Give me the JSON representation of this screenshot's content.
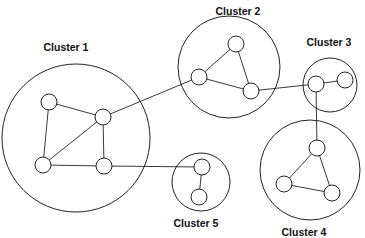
{
  "diagram": {
    "type": "network-clusters",
    "clusters": [
      {
        "id": "c1",
        "label": "Cluster 1",
        "cx": 76,
        "cy": 138,
        "r": 74,
        "label_x": 66,
        "label_y": 51
      },
      {
        "id": "c2",
        "label": "Cluster 2",
        "cx": 229,
        "cy": 67,
        "r": 51,
        "label_x": 238,
        "label_y": 15
      },
      {
        "id": "c3",
        "label": "Cluster 3",
        "cx": 330,
        "cy": 85,
        "r": 27,
        "label_x": 329,
        "label_y": 46
      },
      {
        "id": "c4",
        "label": "Cluster 4",
        "cx": 310,
        "cy": 170,
        "r": 50,
        "label_x": 304,
        "label_y": 236
      },
      {
        "id": "c5",
        "label": "Cluster 5",
        "cx": 201,
        "cy": 182,
        "r": 29,
        "label_x": 196,
        "label_y": 227
      }
    ],
    "nodes": [
      {
        "id": "n1a",
        "cluster": "c1",
        "x": 49,
        "y": 102
      },
      {
        "id": "n1b",
        "cluster": "c1",
        "x": 103,
        "y": 117
      },
      {
        "id": "n1c",
        "cluster": "c1",
        "x": 43,
        "y": 165
      },
      {
        "id": "n1d",
        "cluster": "c1",
        "x": 104,
        "y": 166
      },
      {
        "id": "n2a",
        "cluster": "c2",
        "x": 236,
        "y": 44
      },
      {
        "id": "n2b",
        "cluster": "c2",
        "x": 199,
        "y": 77
      },
      {
        "id": "n2c",
        "cluster": "c2",
        "x": 251,
        "y": 91
      },
      {
        "id": "n3a",
        "cluster": "c3",
        "x": 316,
        "y": 84
      },
      {
        "id": "n3b",
        "cluster": "c3",
        "x": 345,
        "y": 80
      },
      {
        "id": "n4a",
        "cluster": "c4",
        "x": 317,
        "y": 148
      },
      {
        "id": "n4b",
        "cluster": "c4",
        "x": 284,
        "y": 184
      },
      {
        "id": "n4c",
        "cluster": "c4",
        "x": 332,
        "y": 193
      },
      {
        "id": "n5a",
        "cluster": "c5",
        "x": 202,
        "y": 167
      },
      {
        "id": "n5b",
        "cluster": "c5",
        "x": 199,
        "y": 197
      }
    ],
    "edges": [
      [
        "n1a",
        "n1b"
      ],
      [
        "n1a",
        "n1c"
      ],
      [
        "n1b",
        "n1c"
      ],
      [
        "n1b",
        "n1d"
      ],
      [
        "n1c",
        "n1d"
      ],
      [
        "n2a",
        "n2b"
      ],
      [
        "n2a",
        "n2c"
      ],
      [
        "n2b",
        "n2c"
      ],
      [
        "n3a",
        "n3b"
      ],
      [
        "n4a",
        "n4b"
      ],
      [
        "n4a",
        "n4c"
      ],
      [
        "n4b",
        "n4c"
      ],
      [
        "n5a",
        "n5b"
      ],
      [
        "n1b",
        "n2b"
      ],
      [
        "n2c",
        "n3a"
      ],
      [
        "n3a",
        "n4a"
      ],
      [
        "n1d",
        "n5a"
      ]
    ],
    "node_radius": 8
  }
}
